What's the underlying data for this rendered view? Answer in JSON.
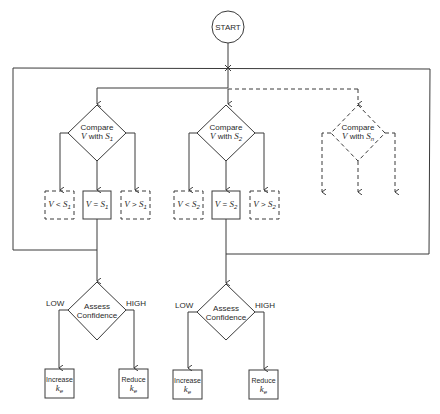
{
  "diagram": {
    "start": {
      "label": "START"
    },
    "compare_nodes": [
      {
        "line1": "Compare",
        "line2_prefix": "V with ",
        "var": "S",
        "sub": "1",
        "style": "solid"
      },
      {
        "line1": "Compare",
        "line2_prefix": "V with ",
        "var": "S",
        "sub": "2",
        "style": "solid"
      },
      {
        "line1": "Compare",
        "line2_prefix": "V with ",
        "var": "S",
        "sub": "n",
        "style": "dashed"
      }
    ],
    "outcomes_s1": [
      {
        "label": "V < S1",
        "op": "<",
        "sub": "1",
        "style": "dashed"
      },
      {
        "label": "V = S1",
        "op": "=",
        "sub": "1",
        "style": "solid"
      },
      {
        "label": "V > S1",
        "op": ">",
        "sub": "1",
        "style": "dashed"
      }
    ],
    "outcomes_s2": [
      {
        "label": "V < S2",
        "op": "<",
        "sub": "2",
        "style": "dashed"
      },
      {
        "label": "V = S2",
        "op": "=",
        "sub": "2",
        "style": "solid"
      },
      {
        "label": "V > S2",
        "op": ">",
        "sub": "2",
        "style": "dashed"
      }
    ],
    "assess_nodes": [
      {
        "line1": "Assess",
        "line2": "Confidence",
        "low_label": "LOW",
        "high_label": "HIGH"
      },
      {
        "line1": "Assess",
        "line2": "Confidence",
        "low_label": "LOW",
        "high_label": "HIGH"
      }
    ],
    "action_nodes": [
      {
        "line1": "Increase",
        "var": "k",
        "sub": "e"
      },
      {
        "line1": "Reduce",
        "var": "k",
        "sub": "e"
      },
      {
        "line1": "Increase",
        "var": "k",
        "sub": "e"
      },
      {
        "line1": "Reduce",
        "var": "k",
        "sub": "e"
      }
    ],
    "colors": {
      "stroke": "#3a3a3a",
      "text": "#2a2a2a",
      "background": "#ffffff"
    }
  }
}
